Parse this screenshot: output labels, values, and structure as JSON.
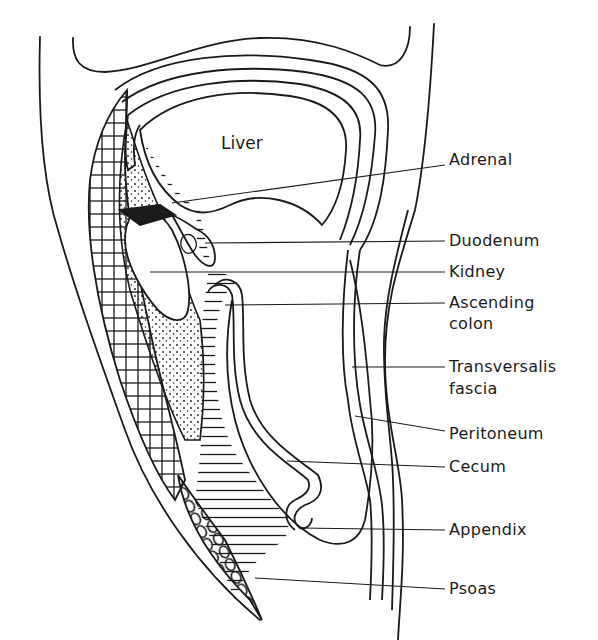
{
  "diagram": {
    "title": "",
    "organ_label": "Liver",
    "labels": [
      {
        "id": "adrenal",
        "text": "Adrenal",
        "lines": [
          "Adrenal"
        ]
      },
      {
        "id": "duodenum",
        "text": "Duodenum",
        "lines": [
          "Duodenum"
        ]
      },
      {
        "id": "kidney",
        "text": "Kidney",
        "lines": [
          "Kidney"
        ]
      },
      {
        "id": "ascending-colon",
        "text": "Ascending colon",
        "lines": [
          "Ascending",
          "colon"
        ]
      },
      {
        "id": "transversalis-fascia",
        "text": "Transversalis fascia",
        "lines": [
          "Transversalis",
          "fascia"
        ]
      },
      {
        "id": "peritoneum",
        "text": "Peritoneum",
        "lines": [
          "Peritoneum"
        ]
      },
      {
        "id": "cecum",
        "text": "Cecum",
        "lines": [
          "Cecum"
        ]
      },
      {
        "id": "appendix",
        "text": "Appendix",
        "lines": [
          "Appendix"
        ]
      },
      {
        "id": "psoas",
        "text": "Psoas",
        "lines": [
          "Psoas"
        ]
      }
    ],
    "colors": {
      "ink": "#1a1a1a",
      "background": "#ffffff"
    }
  }
}
